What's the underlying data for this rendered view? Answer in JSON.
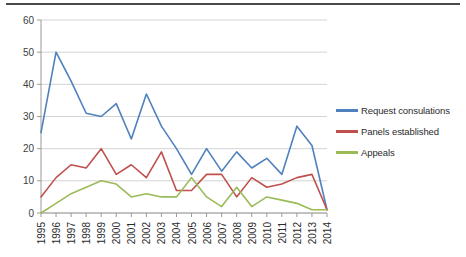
{
  "chart_data": {
    "type": "line",
    "title": "",
    "xlabel": "",
    "ylabel": "",
    "categories": [
      "1995",
      "1996",
      "1997",
      "1998",
      "1999",
      "2000",
      "2001",
      "2002",
      "2003",
      "2004",
      "2005",
      "2006",
      "2007",
      "2008",
      "2009",
      "2010",
      "2011",
      "2012",
      "2013",
      "2014"
    ],
    "ylim": [
      0,
      60
    ],
    "ytick_step": 10,
    "yticks": [
      "0",
      "10",
      "20",
      "30",
      "40",
      "50",
      "60"
    ],
    "grid": "horizontal",
    "legend_position": "right",
    "series": [
      {
        "name": "Request consulations",
        "color": "#4f81bd",
        "values": [
          25,
          50,
          41,
          31,
          30,
          34,
          23,
          37,
          27,
          20,
          12,
          20,
          13,
          19,
          14,
          17,
          12,
          27,
          21,
          1
        ]
      },
      {
        "name": "Panels established",
        "color": "#c0504d",
        "values": [
          5,
          11,
          15,
          14,
          20,
          12,
          15,
          11,
          19,
          7,
          7,
          12,
          12,
          5,
          11,
          8,
          9,
          11,
          12,
          1
        ]
      },
      {
        "name": "Appeals",
        "color": "#9bbb59",
        "values": [
          0,
          3,
          6,
          8,
          10,
          9,
          5,
          6,
          5,
          5,
          11,
          5,
          2,
          8,
          2,
          5,
          4,
          3,
          1,
          1
        ]
      }
    ]
  },
  "legend": {
    "items": [
      {
        "label": "Request consulations",
        "color": "#4f81bd"
      },
      {
        "label": "Panels established",
        "color": "#c0504d"
      },
      {
        "label": "Appeals",
        "color": "#9bbb59"
      }
    ]
  }
}
